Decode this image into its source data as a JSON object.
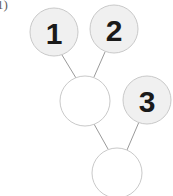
{
  "figure": {
    "corner_label": "1)",
    "background_color": "#ffffff",
    "node_fill_filled": "#f0f0f0",
    "node_fill_empty": "#ffffff",
    "node_stroke": "#c9c9c9",
    "edge_stroke": "#9a9a9a",
    "label_color": "#1a1a1a"
  },
  "nodes": [
    {
      "id": "n1",
      "label": "1",
      "cx": 54,
      "cy": 32,
      "r": 24,
      "filled": true
    },
    {
      "id": "n2",
      "label": "2",
      "cx": 114,
      "cy": 29,
      "r": 24,
      "filled": true
    },
    {
      "id": "n4",
      "label": "",
      "cx": 85,
      "cy": 101,
      "r": 25,
      "filled": false
    },
    {
      "id": "n3",
      "label": "3",
      "cx": 147,
      "cy": 100,
      "r": 24,
      "filled": true
    },
    {
      "id": "n5",
      "label": "",
      "cx": 117,
      "cy": 173,
      "r": 25,
      "filled": false
    }
  ],
  "edges": [
    {
      "from": "n1",
      "to": "n4",
      "x1": 62,
      "y1": 55,
      "x2": 76,
      "y2": 78
    },
    {
      "from": "n2",
      "to": "n4",
      "x1": 105,
      "y1": 52,
      "x2": 94,
      "y2": 77
    },
    {
      "from": "n4",
      "to": "n5",
      "x1": 94,
      "y1": 124,
      "x2": 108,
      "y2": 149
    },
    {
      "from": "n3",
      "to": "n5",
      "x1": 139,
      "y1": 122,
      "x2": 127,
      "y2": 150
    }
  ]
}
